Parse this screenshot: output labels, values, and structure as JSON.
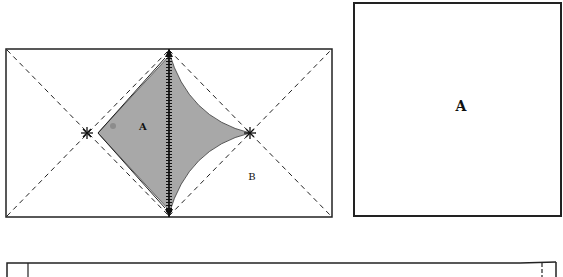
{
  "diagram": {
    "left_panel": {
      "region_a_label": "A",
      "region_b_label": "B",
      "shaded_color": "#a8a8a8",
      "line_color": "#222222"
    },
    "right_panel": {
      "label": "A"
    },
    "bottom_panel": {}
  }
}
